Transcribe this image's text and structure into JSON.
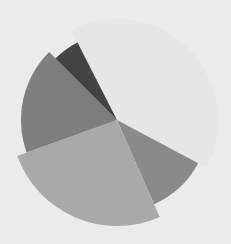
{
  "chart_data": {
    "type": "pie",
    "variant": "variable-radius (exploded/rose style)",
    "title": "",
    "legend": [],
    "center": [
      117,
      120
    ],
    "start_angle_deg": 333,
    "slices": [
      {
        "label": "",
        "percent": 40.3,
        "radius": 101,
        "color": "#e6e6e6"
      },
      {
        "label": "",
        "percent": 10.6,
        "radius": 92,
        "color": "#8a8a8a"
      },
      {
        "label": "",
        "percent": 26.1,
        "radius": 106,
        "color": "#a9a9a9"
      },
      {
        "label": "",
        "percent": 18.0,
        "radius": 96,
        "color": "#7e7e7e"
      },
      {
        "label": "",
        "percent": 5.0,
        "radius": 87,
        "color": "#434343"
      }
    ],
    "values": [
      40.3,
      10.6,
      26.1,
      18.0,
      5.0
    ],
    "categories": [
      "Slice 1",
      "Slice 2",
      "Slice 3",
      "Slice 4",
      "Slice 5"
    ],
    "background": "#ebebeb"
  }
}
